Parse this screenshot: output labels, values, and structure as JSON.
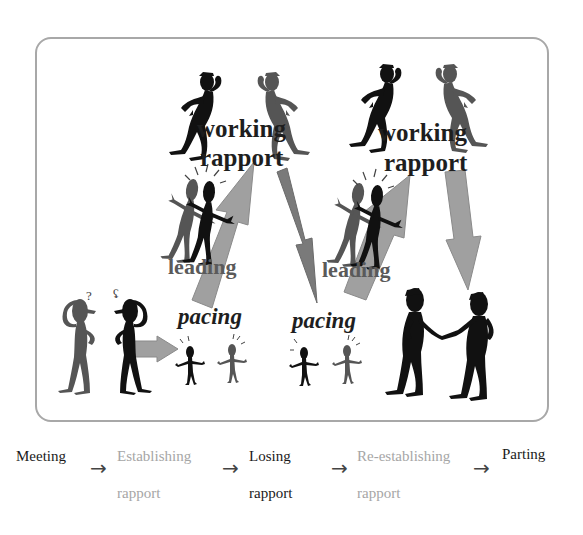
{
  "diagram": {
    "colors": {
      "frame_border": "#a8a8a8",
      "arrow_light": "#a0a0a0",
      "arrow_dark": "#7a7a7a",
      "figure_black": "#111111",
      "figure_gray": "#555555",
      "text_dark": "#1a1a1a",
      "text_light": "#a6a6a6"
    },
    "labels": {
      "working_1": "working",
      "rapport_1": "rapport",
      "working_2": "working",
      "rapport_2": "rapport",
      "leading_1": "leading",
      "leading_2": "leading",
      "pacing_1": "pacing",
      "pacing_2": "pacing"
    },
    "icons": {
      "confused_pair": "confused-figures-icon",
      "excited_pair": "excited-figures-icon",
      "leaning_pair": "leaning-figures-icon",
      "listening_pair": "listening-figures-icon",
      "handshake_pair": "handshake-figures-icon"
    }
  },
  "timeline": {
    "steps": [
      {
        "line1": "Meeting",
        "line2": "",
        "style": "dark"
      },
      {
        "line1": "Establishing",
        "line2": "rapport",
        "style": "light"
      },
      {
        "line1": "Losing",
        "line2": "rapport",
        "style": "dark"
      },
      {
        "line1": "Re-establishing",
        "line2": "rapport",
        "style": "light"
      },
      {
        "line1": "Parting",
        "line2": "",
        "style": "dark"
      }
    ],
    "arrow_glyph": "→"
  }
}
